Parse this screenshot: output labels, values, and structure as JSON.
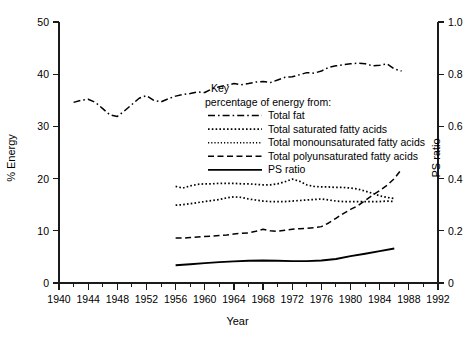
{
  "chart_data": {
    "type": "line",
    "title": "",
    "xlabel": "Year",
    "ylabel": "% Energy",
    "ylabel_right": "PS ratio",
    "xlim": [
      1940,
      1992
    ],
    "ylim": [
      0,
      50
    ],
    "ylim_right": [
      0,
      1.0
    ],
    "grid": false,
    "legend_position": "inside-upper-center",
    "legend_title": "Key",
    "legend_subtitle": "percentage of energy from:",
    "xticks": [
      1940,
      1944,
      1948,
      1952,
      1956,
      1960,
      1964,
      1968,
      1972,
      1976,
      1980,
      1984,
      1988,
      1992
    ],
    "xtick_labels": [
      "1940",
      "1944",
      "1948",
      "1952",
      "1956",
      "1960",
      "1964",
      "1968",
      "1972",
      "1976",
      "1980",
      "1984",
      "1988",
      "1992"
    ],
    "xminor_step": 2,
    "yticks": [
      0,
      10,
      20,
      30,
      40,
      50
    ],
    "ytick_labels": [
      "0",
      "10",
      "20",
      "30",
      "40",
      "50"
    ],
    "yticks_right": [
      0,
      0.2,
      0.4,
      0.6,
      0.8,
      1.0
    ],
    "ytick_labels_right": [
      "0",
      "0.2",
      "0.4",
      "0.6",
      "0.8",
      "1.0"
    ],
    "series": [
      {
        "name": "Total fat",
        "style": "dash-dot",
        "axis": "left",
        "x": [
          1942,
          1943,
          1944,
          1945,
          1946,
          1947,
          1948,
          1949,
          1950,
          1951,
          1952,
          1953,
          1954,
          1955,
          1956,
          1957,
          1958,
          1959,
          1960,
          1961,
          1962,
          1963,
          1964,
          1965,
          1966,
          1967,
          1968,
          1969,
          1970,
          1971,
          1972,
          1973,
          1974,
          1975,
          1976,
          1977,
          1978,
          1979,
          1980,
          1981,
          1982,
          1983,
          1984,
          1985,
          1986,
          1987
        ],
        "values": [
          34.6,
          35.0,
          35.2,
          34.6,
          33.4,
          32.2,
          31.9,
          33.0,
          34.2,
          35.4,
          35.9,
          35.0,
          34.7,
          35.3,
          35.8,
          36.1,
          36.3,
          36.6,
          36.5,
          37.2,
          37.6,
          37.9,
          38.2,
          38.0,
          38.2,
          38.5,
          38.6,
          38.4,
          38.9,
          39.4,
          39.5,
          39.9,
          40.3,
          40.2,
          40.6,
          41.3,
          41.6,
          41.8,
          42.0,
          42.1,
          42.0,
          41.6,
          41.7,
          42.0,
          41.0,
          40.6
        ]
      },
      {
        "name": "Total saturated fatty acids",
        "style": "dotted",
        "axis": "left",
        "x": [
          1956,
          1957,
          1958,
          1959,
          1960,
          1961,
          1962,
          1963,
          1964,
          1965,
          1966,
          1967,
          1968,
          1969,
          1970,
          1971,
          1972,
          1973,
          1974,
          1975,
          1976,
          1977,
          1978,
          1979,
          1980,
          1981,
          1982,
          1983,
          1984,
          1985,
          1986
        ],
        "values": [
          18.5,
          18.2,
          18.6,
          18.9,
          19.0,
          19.0,
          19.1,
          19.1,
          19.1,
          19.0,
          19.0,
          18.9,
          18.8,
          18.8,
          19.0,
          19.4,
          19.9,
          19.5,
          18.8,
          18.5,
          18.4,
          18.4,
          18.3,
          18.3,
          18.2,
          18.0,
          17.6,
          17.2,
          16.7,
          16.4,
          16.2
        ]
      },
      {
        "name": "Total monounsaturated fatty acids",
        "style": "dotted",
        "axis": "left",
        "x": [
          1956,
          1957,
          1958,
          1959,
          1960,
          1961,
          1962,
          1963,
          1964,
          1965,
          1966,
          1967,
          1968,
          1969,
          1970,
          1971,
          1972,
          1973,
          1974,
          1975,
          1976,
          1977,
          1978,
          1979,
          1980,
          1981,
          1982,
          1983,
          1984,
          1985,
          1986
        ],
        "values": [
          14.9,
          15.0,
          15.2,
          15.4,
          15.6,
          15.8,
          16.0,
          16.3,
          16.5,
          16.4,
          16.1,
          15.9,
          15.7,
          15.6,
          15.6,
          15.6,
          15.7,
          15.8,
          15.9,
          16.0,
          16.1,
          15.9,
          15.7,
          15.6,
          15.6,
          15.6,
          15.6,
          15.6,
          15.6,
          15.7,
          15.6
        ]
      },
      {
        "name": "Total polyunsaturated fatty acids",
        "style": "dashed",
        "axis": "left",
        "x": [
          1956,
          1957,
          1958,
          1959,
          1960,
          1961,
          1962,
          1963,
          1964,
          1965,
          1966,
          1967,
          1968,
          1969,
          1970,
          1971,
          1972,
          1973,
          1974,
          1975,
          1976,
          1977,
          1978,
          1979,
          1980,
          1981,
          1982,
          1983,
          1984,
          1985,
          1986,
          1987
        ],
        "values": [
          8.6,
          8.6,
          8.7,
          8.8,
          8.9,
          9.0,
          9.1,
          9.2,
          9.4,
          9.5,
          9.6,
          9.9,
          10.3,
          10.0,
          9.9,
          10.1,
          10.3,
          10.4,
          10.5,
          10.6,
          10.8,
          11.5,
          12.4,
          13.3,
          14.1,
          14.8,
          15.8,
          16.8,
          17.7,
          18.7,
          20.0,
          21.8
        ]
      },
      {
        "name": "PS ratio",
        "style": "solid",
        "axis": "right",
        "x": [
          1956,
          1958,
          1960,
          1962,
          1964,
          1966,
          1968,
          1970,
          1972,
          1974,
          1976,
          1978,
          1980,
          1982,
          1984,
          1986
        ],
        "values": [
          0.068,
          0.072,
          0.076,
          0.08,
          0.083,
          0.085,
          0.086,
          0.085,
          0.084,
          0.084,
          0.086,
          0.092,
          0.103,
          0.112,
          0.122,
          0.132
        ]
      }
    ]
  },
  "legend": {
    "title": "Key",
    "subtitle": "percentage of energy from:",
    "entries": [
      {
        "label": "Total fat",
        "style": "dash-dot"
      },
      {
        "label": "Total saturated fatty acids",
        "style": "dotted"
      },
      {
        "label": "Total monounsaturated fatty acids",
        "style": "dotted-fine"
      },
      {
        "label": "Total polyunsaturated fatty acids",
        "style": "dashed"
      },
      {
        "label": "PS ratio",
        "style": "solid"
      }
    ]
  },
  "axes": {
    "left_title": "% Energy",
    "right_title": "PS ratio",
    "bottom_title": "Year"
  },
  "colors": {
    "line": "#000000",
    "axis": "#1a1a1a",
    "background": "#ffffff"
  }
}
